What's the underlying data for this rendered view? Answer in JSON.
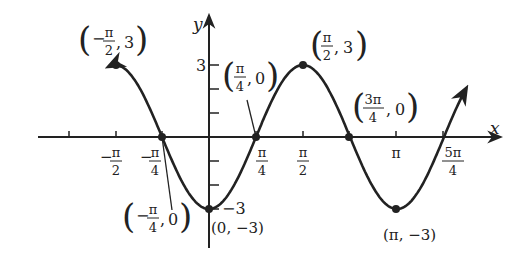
{
  "chart_data": {
    "type": "line",
    "title": "",
    "function": "y = -3cos(2x)",
    "xlabel": "x",
    "ylabel": "y",
    "xlim_radians": [
      -1.95,
      4.3
    ],
    "ylim": [
      -3.5,
      3.5
    ],
    "grid": false,
    "x_tick_labels": [
      {
        "label": "−π/2",
        "num": "π",
        "den": "2",
        "sign": "−",
        "x": -1.5708
      },
      {
        "label": "−π/4",
        "num": "π",
        "den": "4",
        "sign": "−",
        "x": -0.7854
      },
      {
        "label": "π/4",
        "num": "π",
        "den": "4",
        "sign": "",
        "x": 0.7854
      },
      {
        "label": "π/2",
        "num": "π",
        "den": "2",
        "sign": "",
        "x": 1.5708
      },
      {
        "label": "π",
        "x": 3.1416
      },
      {
        "label": "5π/4",
        "num": "5π",
        "den": "4",
        "sign": "",
        "x": 3.927
      }
    ],
    "y_tick_labels": [
      {
        "label": "3",
        "y": 3
      },
      {
        "label": "−3",
        "y": -3
      }
    ],
    "y_minor_ticks": [
      1,
      2,
      -1,
      -2
    ],
    "points": [
      {
        "label": "(−π/2, 3)",
        "x": -1.5708,
        "y": 3
      },
      {
        "label": "(−π/4, 0)",
        "x": -0.7854,
        "y": 0
      },
      {
        "label": "(0, −3)",
        "x": 0,
        "y": -3
      },
      {
        "label": "(π/4, 0)",
        "x": 0.7854,
        "y": 0
      },
      {
        "label": "(π/2, 3)",
        "x": 1.5708,
        "y": 3
      },
      {
        "label": "(3π/4, 0)",
        "x": 2.3562,
        "y": 0
      },
      {
        "label": "(π, −3)",
        "x": 3.1416,
        "y": -3
      }
    ],
    "annotations": [
      {
        "text": "(−π/2, 3)",
        "sign": "−",
        "num": "π",
        "den": "2",
        "yv": "3"
      },
      {
        "text": "(π/4, 0)",
        "sign": "",
        "num": "π",
        "den": "4",
        "yv": "0"
      },
      {
        "text": "(π/2, 3)",
        "sign": "",
        "num": "π",
        "den": "2",
        "yv": "3"
      },
      {
        "text": "(3π/4, 0)",
        "sign": "",
        "num": "3π",
        "den": "4",
        "yv": "0"
      },
      {
        "text": "(−π/4, 0)",
        "sign": "−",
        "num": "π",
        "den": "4",
        "yv": "0"
      },
      {
        "text": "(0, −3)"
      },
      {
        "text": "(π, −3)"
      }
    ],
    "color": "#222222"
  }
}
